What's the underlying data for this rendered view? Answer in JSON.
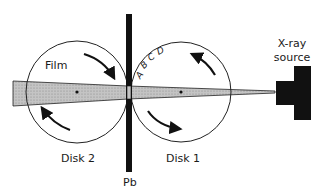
{
  "diagram": {
    "labels": {
      "film": "Film",
      "disk1": "Disk 1",
      "disk2": "Disk 2",
      "lead_shield": "Pb",
      "source_line1": "X-ray",
      "source_line2": "source"
    },
    "sample_letters": [
      "A",
      "B",
      "C",
      "D"
    ],
    "colors": {
      "beam": "#bdbdbd",
      "ink": "#111111",
      "background": "#ffffff"
    },
    "rotation": {
      "disk1": "counter-clockwise",
      "disk2": "clockwise"
    }
  }
}
